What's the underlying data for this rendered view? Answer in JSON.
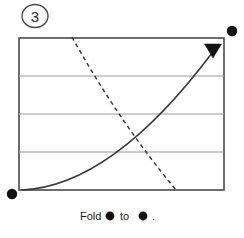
{
  "figure": {
    "step_label": "3",
    "caption_prefix": "Fold",
    "caption_middle": "to",
    "caption_suffix": ".",
    "caption_full": "Fold ● to ● .",
    "colors": {
      "ink": "#1a1a1a",
      "border": "#4a4a4a",
      "gridline": "#9a9a9a",
      "curve": "#3a3a3a",
      "dashed": "#3a3a3a",
      "dot": "#111111",
      "background": "#ffffff"
    }
  },
  "diagram": {
    "type": "paper-folding-instruction",
    "panel": {
      "label": "paper-sheet",
      "x": 19,
      "y": 38,
      "width": 205,
      "height": 152,
      "stroke_width": 1.6
    },
    "creases": {
      "label": "horizontal-fold-creases",
      "count": 3,
      "y_positions": [
        76,
        114,
        152
      ],
      "stroke_width": 1.2
    },
    "fold_arrow": {
      "label": "fold-direction-arrow",
      "style": "solid-curved",
      "start": [
        22,
        190
      ],
      "control": [
        110,
        184
      ],
      "end": [
        213,
        50
      ],
      "arrowhead": {
        "shape": "filled-triangle",
        "direction": "down",
        "tip": [
          213,
          57
        ],
        "width": 17,
        "height": 13
      }
    },
    "fold_line": {
      "label": "dashed-fold-line",
      "style": "dashed",
      "start": [
        72,
        37
      ],
      "control": [
        118,
        120
      ],
      "end": [
        176,
        190
      ],
      "dash_pattern": "4,3.5"
    },
    "markers": [
      {
        "name": "source-corner-dot",
        "cx": 12,
        "cy": 194,
        "r": 5.2
      },
      {
        "name": "target-corner-dot",
        "cx": 232,
        "cy": 31,
        "r": 5.2
      }
    ],
    "step_badge": {
      "cx": 35,
      "cy": 16,
      "rx": 13,
      "ry": 12
    }
  }
}
